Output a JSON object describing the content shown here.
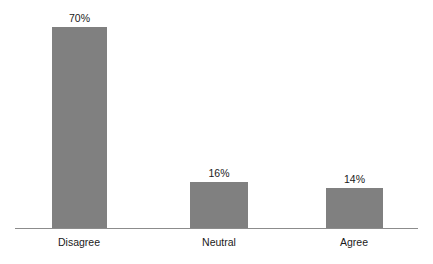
{
  "chart_data": {
    "type": "bar",
    "title": "",
    "subtitle": "",
    "xlabel": "",
    "ylabel": "",
    "categories": [
      "Disagree",
      "Neutral",
      "Agree"
    ],
    "values": [
      70,
      16,
      14
    ],
    "value_labels": [
      "70%",
      "16%",
      "14%"
    ],
    "unit": "%",
    "ylim": [
      0,
      78
    ],
    "grid": false,
    "legend": false,
    "legend_position": "none",
    "axis_visible": {
      "x": true,
      "y": false
    },
    "bar_color": "#808080",
    "text_color": "#1a1a1a",
    "axis_color": "#8c8c8c",
    "background_color": "#ffffff",
    "bars": [
      {
        "category": "Disagree",
        "value": 70,
        "value_label": "70%",
        "left_px": 52,
        "width_px": 55,
        "height_px": 202,
        "center_px": 79
      },
      {
        "category": "Neutral",
        "value": 16,
        "value_label": "16%",
        "left_px": 190,
        "width_px": 58,
        "height_px": 47,
        "center_px": 219
      },
      {
        "category": "Agree",
        "value": 14,
        "value_label": "14%",
        "left_px": 326,
        "width_px": 57,
        "height_px": 41,
        "center_px": 354
      }
    ]
  }
}
